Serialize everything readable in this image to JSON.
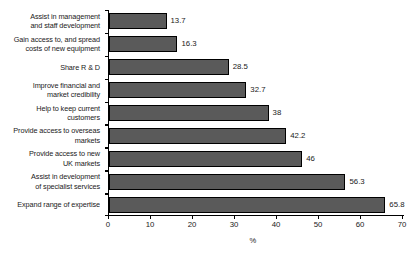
{
  "chart_data": {
    "type": "bar",
    "orientation": "horizontal",
    "title": "",
    "xlabel": "%",
    "ylabel": "",
    "xlim": [
      0,
      70
    ],
    "xticks": [
      0,
      10,
      20,
      30,
      40,
      50,
      60,
      70
    ],
    "grid": false,
    "legend": null,
    "bar_color": "#5a5a5a",
    "bar_edge_color": "#000000",
    "categories": [
      "Assist in management\nand staff development",
      "Gain access to, and spread\ncosts of new equipment",
      "Share R & D",
      "Improve financial and\nmarket credibility",
      "Help to keep current\ncustomers",
      "Provide access to overseas\nmarkets",
      "Provide access to new\nUK markets",
      "Assist in development\nof specialist services",
      "Expand range of expertise"
    ],
    "values": [
      13.7,
      16.3,
      28.5,
      32.7,
      38,
      42.2,
      46,
      56.3,
      65.8
    ],
    "value_labels": [
      "13.7",
      "16.3",
      "28.5",
      "32.7",
      "38",
      "42.2",
      "46",
      "56.3",
      "65.8"
    ],
    "xtick_labels": [
      "0",
      "10",
      "20",
      "30",
      "40",
      "50",
      "60",
      "70"
    ]
  }
}
